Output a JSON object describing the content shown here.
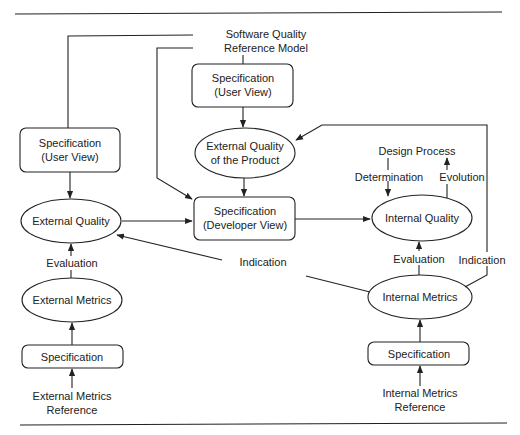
{
  "diagram": {
    "type": "flow",
    "top_source": {
      "line1": "Software Quality",
      "line2": "Reference Model"
    },
    "nodes": {
      "spec_user_view_top": {
        "line1": "Specification",
        "line2": "(User View)"
      },
      "ext_quality_product": {
        "line1": "External Quality",
        "line2": "of the Product"
      },
      "spec_developer_view": {
        "line1": "Specification",
        "line2": "(Developer View)"
      },
      "spec_user_view_left": {
        "line1": "Specification",
        "line2": "(User View)"
      },
      "external_quality": {
        "label": "External Quality"
      },
      "external_metrics": {
        "label": "External Metrics"
      },
      "ext_spec": {
        "label": "Specification"
      },
      "ext_metrics_reference": {
        "line1": "External Metrics",
        "line2": "Reference"
      },
      "internal_quality": {
        "label": "Internal Quality"
      },
      "internal_metrics": {
        "label": "Internal Metrics"
      },
      "int_spec": {
        "label": "Specification"
      },
      "int_metrics_reference": {
        "line1": "Internal Metrics",
        "line2": "Reference"
      },
      "design_process": {
        "label": "Design Process"
      }
    },
    "edge_labels": {
      "ext_evaluation": "Evaluation",
      "int_evaluation": "Evaluation",
      "indication_left": "Indication",
      "indication_right": "Indication",
      "determination": "Determination",
      "evolution": "Evolution"
    },
    "colors": {
      "stroke": "#222222",
      "background": "#ffffff"
    }
  }
}
